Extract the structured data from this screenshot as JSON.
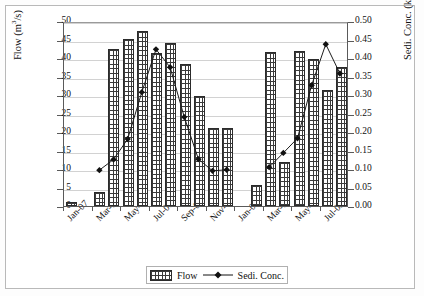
{
  "chart_data": {
    "type": "bar",
    "title": "",
    "xlabel": "",
    "ylabel": "Flow (m3/s)",
    "ylabel_parts": {
      "prefix": "Flow (m",
      "sup": "3",
      "suffix": "/s)"
    },
    "y2label": "Sedi. Conc. (kg/m3)",
    "y2label_parts": {
      "prefix": "Sedi. Conc. (kg/m",
      "sup": "3",
      "suffix": ")"
    },
    "ylim": [
      0,
      50
    ],
    "y2lim": [
      0.0,
      0.5
    ],
    "grid": true,
    "legend_position": "bottom",
    "yticks": [
      "0",
      "5",
      "10",
      "15",
      "20",
      "25",
      "30",
      "35",
      "40",
      "45",
      "50"
    ],
    "y2ticks": [
      "0.00",
      "0.05",
      "0.10",
      "0.15",
      "0.20",
      "0.25",
      "0.30",
      "0.35",
      "0.40",
      "0.45",
      "0.50"
    ],
    "categories": [
      "Jan-07",
      "Feb-07",
      "Mar-07",
      "Apr-07",
      "May-07",
      "Jun-07",
      "Jul-07",
      "Aug-07",
      "Sep-07",
      "Oct-07",
      "Nov-07",
      "Dec-07",
      "Jan-08",
      "Feb-08",
      "Mar-08",
      "Apr-08",
      "May-08",
      "Jun-08",
      "Jul-08",
      "Aug-08"
    ],
    "xtick_labels": [
      "Jan-07",
      "Mar-07",
      "May-07",
      "Jul-07",
      "Sep-07",
      "Nov-07",
      "Jan-08",
      "Mar-08",
      "May-08",
      "Jul-08"
    ],
    "series": [
      {
        "name": "Flow",
        "axis": "left",
        "type": "bar",
        "values": [
          1.2,
          0,
          3.8,
          42.4,
          45.2,
          47.4,
          41.4,
          44.0,
          38.4,
          29.8,
          21.2,
          21.2,
          0,
          5.6,
          41.6,
          11.8,
          41.8,
          39.8,
          31.4,
          37.6
        ]
      },
      {
        "name": "Sedi. Conc.",
        "axis": "right",
        "type": "line",
        "marker": "diamond",
        "values": [
          null,
          null,
          0.098,
          0.127,
          0.183,
          0.311,
          0.428,
          0.379,
          0.243,
          0.128,
          0.096,
          0.099,
          null,
          null,
          0.106,
          0.145,
          0.185,
          0.33,
          0.442,
          0.362
        ]
      }
    ]
  },
  "legend": {
    "items": [
      {
        "label": "Flow",
        "marker": "bar-pattern"
      },
      {
        "label": "Sedi. Conc.",
        "marker": "line-diamond"
      }
    ]
  }
}
